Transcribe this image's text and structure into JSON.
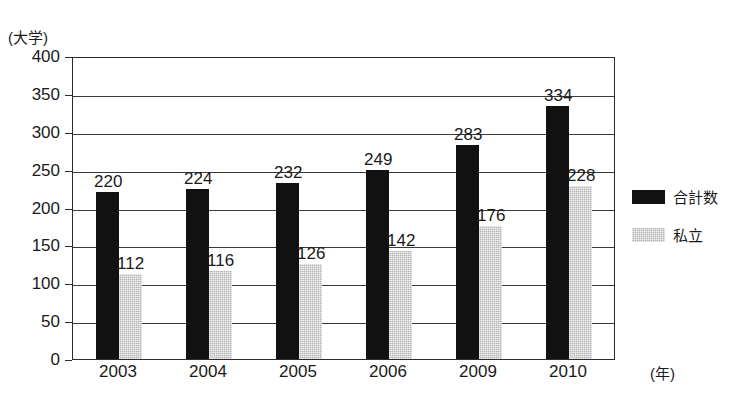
{
  "chart_data": {
    "type": "bar",
    "title": "",
    "subtitle": "",
    "xlabel": "(年)",
    "ylabel": "(大学)",
    "categories": [
      "2003",
      "2004",
      "2005",
      "2006",
      "2009",
      "2010"
    ],
    "series": [
      {
        "name": "合計数",
        "color": "#111111",
        "values": [
          220,
          224,
          232,
          249,
          283,
          334
        ]
      },
      {
        "name": "私立",
        "color": "#b4b4b4",
        "values": [
          112,
          116,
          126,
          142,
          176,
          228
        ]
      }
    ],
    "ylim": [
      0,
      400
    ],
    "yticks": [
      0,
      50,
      100,
      150,
      200,
      250,
      300,
      350,
      400
    ],
    "ytick_labels": [
      "0",
      "50",
      "100",
      "150",
      "200",
      "250",
      "300",
      "350",
      "400"
    ],
    "grid": true,
    "legend_position": "right",
    "data_labels": true
  },
  "legend": {
    "entries": [
      {
        "label": "合計数"
      },
      {
        "label": "私立"
      }
    ]
  }
}
